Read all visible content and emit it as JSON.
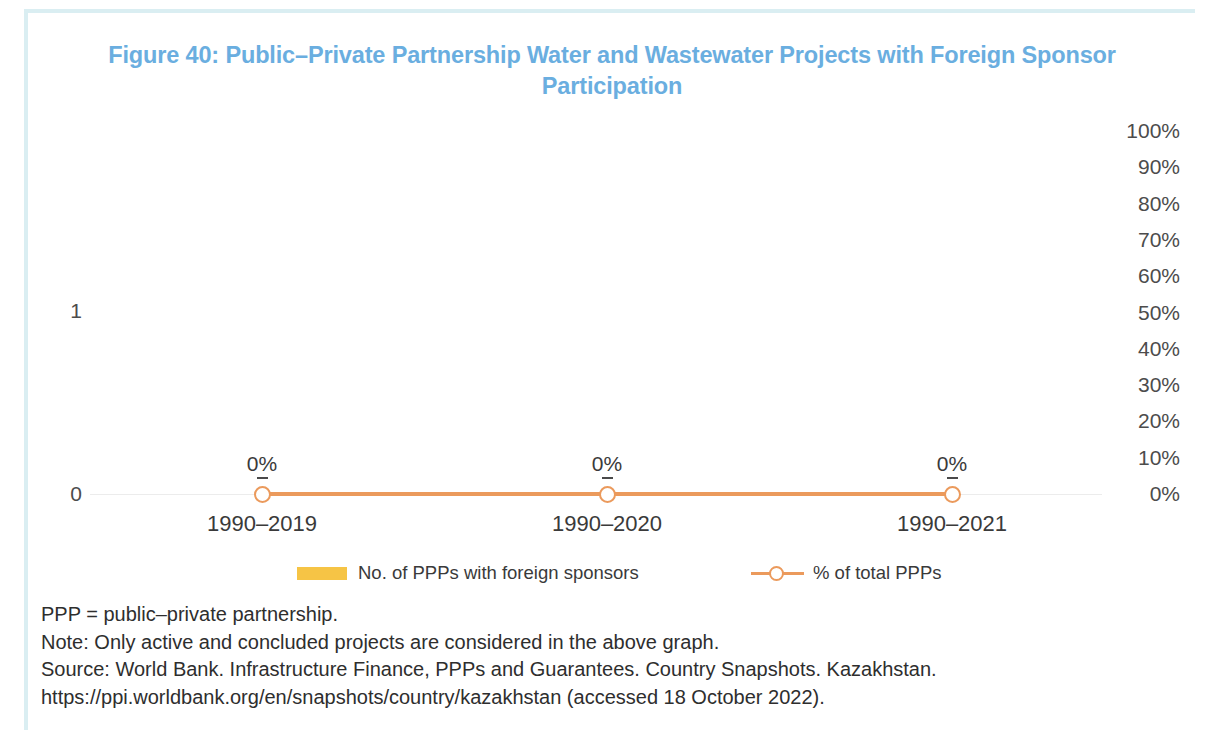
{
  "figure": {
    "title": "Figure 40: Public–Private Partnership Water and Wastewater Projects with Foreign Sponsor Participation",
    "title_color": "#6aaee0"
  },
  "notes": {
    "abbreviation": "PPP = public–private partnership.",
    "note": "Note: Only active and concluded projects are considered in the above graph.",
    "source": "Source: World Bank. Infrastructure Finance, PPPs and Guarantees. Country Snapshots. Kazakhstan. https://ppi.worldbank.org/en/snapshots/country/kazakhstan (accessed 18 October 2022)."
  },
  "chart_data": {
    "type": "bar",
    "title": "Figure 40: Public–Private Partnership Water and Wastewater Projects with Foreign Sponsor Participation",
    "xlabel": "",
    "ylabel": "",
    "categories": [
      "1990–2019",
      "1990–2020",
      "1990–2021"
    ],
    "series": [
      {
        "name": "No. of PPPs with foreign sponsors",
        "type": "bar",
        "axis": "left",
        "color": "#f6c445",
        "values": [
          0,
          0,
          0
        ]
      },
      {
        "name": "% of total PPPs",
        "type": "line",
        "axis": "right",
        "color": "#eb9a5c",
        "marker": "open-circle",
        "values": [
          0,
          0,
          0
        ],
        "data_labels": [
          "0%",
          "0%",
          "0%"
        ]
      }
    ],
    "left_axis": {
      "ticks": [
        "0",
        "1"
      ],
      "values": [
        0,
        1
      ],
      "ylim": [
        0,
        1
      ]
    },
    "right_axis": {
      "ticks": [
        "0%",
        "10%",
        "20%",
        "30%",
        "40%",
        "50%",
        "60%",
        "70%",
        "80%",
        "90%",
        "100%"
      ],
      "values": [
        0,
        10,
        20,
        30,
        40,
        50,
        60,
        70,
        80,
        90,
        100
      ],
      "ylim": [
        0,
        100
      ]
    },
    "grid": "single baseline gridline at 0",
    "legend_position": "bottom"
  }
}
